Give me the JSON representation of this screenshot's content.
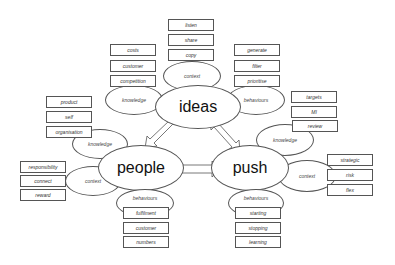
{
  "diagram": {
    "hubs": {
      "ideas": {
        "label": "ideas"
      },
      "people": {
        "label": "people"
      },
      "push": {
        "label": "push"
      }
    },
    "ideas": {
      "context": {
        "label": "context",
        "items": [
          "listen",
          "share",
          "copy"
        ]
      },
      "knowledge": {
        "label": "knowledge",
        "items": [
          "costs",
          "customer",
          "competition"
        ]
      },
      "behaviours": {
        "label": "behaviours",
        "items": [
          "generate",
          "filter",
          "prioritise"
        ]
      }
    },
    "people": {
      "knowledge": {
        "label": "knowledge",
        "items": [
          "product",
          "self",
          "organisation"
        ]
      },
      "context": {
        "label": "context",
        "items": [
          "responsibility",
          "connect",
          "reward"
        ]
      },
      "behaviours": {
        "label": "behaviours",
        "items": [
          "fulfilment",
          "customer",
          "numbers"
        ]
      }
    },
    "push": {
      "knowledge": {
        "label": "knowledge",
        "items": [
          "targets",
          "MI",
          "review"
        ]
      },
      "context": {
        "label": "context",
        "items": [
          "strategic",
          "risk",
          "flex"
        ]
      },
      "behaviours": {
        "label": "behaviours",
        "items": [
          "starting",
          "stopping",
          "learning"
        ]
      }
    },
    "arrows": [
      "ideas-people",
      "ideas-push",
      "people-push"
    ]
  }
}
